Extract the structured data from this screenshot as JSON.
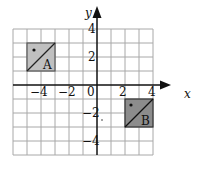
{
  "diagram": {
    "type": "coordinate-grid",
    "x_axis": {
      "label": "x",
      "min": -6,
      "max": 4,
      "ticks": [
        "-4",
        "-2",
        "0",
        "2",
        "4"
      ]
    },
    "y_axis": {
      "label": "y",
      "min": -5,
      "max": 4,
      "ticks": [
        "4",
        "2",
        "-2",
        "-4"
      ]
    },
    "shapes": [
      {
        "name": "A",
        "label": "A",
        "x_range": [
          -5,
          -3
        ],
        "y_range": [
          1,
          3
        ],
        "fill": "#c0c0c0",
        "has_dot": true,
        "diagonal": "bottom-left to top-right"
      },
      {
        "name": "B",
        "label": "B",
        "x_range": [
          2,
          4
        ],
        "y_range": [
          -3,
          -1
        ],
        "fill": "#8c8c8c",
        "has_dot": true,
        "diagonal": "bottom-left to top-right"
      }
    ],
    "colors": {
      "grid": "#a8a8a8",
      "axis": "#111111",
      "shape_a": "#c0c0c0",
      "shape_b": "#8c8c8c"
    }
  }
}
